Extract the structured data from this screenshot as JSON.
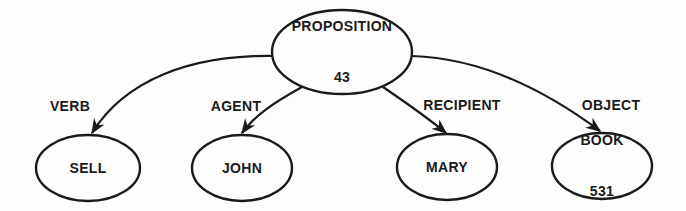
{
  "diagram": {
    "type": "propositional-network",
    "colors": {
      "stroke": "#1a1a1a",
      "background": "#fdfdfd",
      "text": "#1a1a1a"
    },
    "root": {
      "label": "PROPOSITION",
      "number": "43"
    },
    "nodes": [
      {
        "label": "SELL",
        "number": ""
      },
      {
        "label": "JOHN",
        "number": ""
      },
      {
        "label": "MARY",
        "number": ""
      },
      {
        "label": "BOOK",
        "number": "531"
      }
    ],
    "edges": [
      {
        "from": "PROPOSITION 43",
        "to": "SELL",
        "label": "VERB"
      },
      {
        "from": "PROPOSITION 43",
        "to": "JOHN",
        "label": "AGENT"
      },
      {
        "from": "PROPOSITION 43",
        "to": "MARY",
        "label": "RECIPIENT"
      },
      {
        "from": "PROPOSITION 43",
        "to": "BOOK",
        "label": "OBJECT"
      }
    ]
  }
}
